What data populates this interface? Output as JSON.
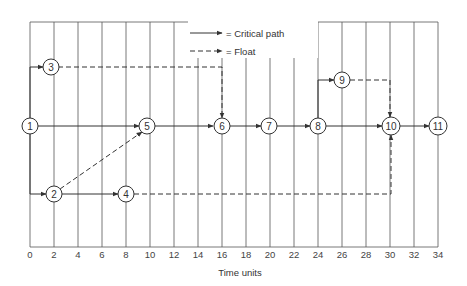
{
  "diagram": {
    "type": "time-scaled network diagram",
    "legend": [
      {
        "style": "solid",
        "label": "= Critical path"
      },
      {
        "style": "dashed",
        "label": "= Float"
      }
    ],
    "x_axis": {
      "label": "Time units",
      "ticks": [
        "0",
        "2",
        "4",
        "6",
        "8",
        "10",
        "12",
        "14",
        "16",
        "18",
        "20",
        "22",
        "24",
        "26",
        "28",
        "30",
        "32",
        "34"
      ]
    },
    "nodes": [
      {
        "id": "1",
        "label": "1",
        "time": 0
      },
      {
        "id": "2",
        "label": "2",
        "time": 2
      },
      {
        "id": "3",
        "label": "3",
        "time": 2
      },
      {
        "id": "4",
        "label": "4",
        "time": 8
      },
      {
        "id": "5",
        "label": "5",
        "time": 10
      },
      {
        "id": "6",
        "label": "6",
        "time": 16
      },
      {
        "id": "7",
        "label": "7",
        "time": 20
      },
      {
        "id": "8",
        "label": "8",
        "time": 24
      },
      {
        "id": "9",
        "label": "9",
        "time": 26
      },
      {
        "id": "10",
        "label": "10",
        "time": 30
      },
      {
        "id": "11",
        "label": "11",
        "time": 34
      }
    ],
    "edges": [
      {
        "from": "1",
        "to": "3",
        "style": "solid"
      },
      {
        "from": "1",
        "to": "5",
        "style": "solid"
      },
      {
        "from": "1",
        "to": "2",
        "style": "solid"
      },
      {
        "from": "3",
        "to": "6",
        "style": "dashed"
      },
      {
        "from": "2",
        "to": "5",
        "style": "dashed"
      },
      {
        "from": "2",
        "to": "4",
        "style": "solid"
      },
      {
        "from": "4",
        "to": "10",
        "style": "dashed"
      },
      {
        "from": "5",
        "to": "6",
        "style": "solid"
      },
      {
        "from": "6",
        "to": "7",
        "style": "solid"
      },
      {
        "from": "7",
        "to": "8",
        "style": "solid"
      },
      {
        "from": "8",
        "to": "9",
        "style": "solid"
      },
      {
        "from": "8",
        "to": "10",
        "style": "solid"
      },
      {
        "from": "9",
        "to": "10",
        "style": "dashed"
      },
      {
        "from": "10",
        "to": "11",
        "style": "solid"
      }
    ]
  }
}
